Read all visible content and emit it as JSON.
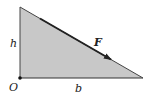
{
  "diagram": {
    "type": "right-triangle-force",
    "labels": {
      "height": "h",
      "base": "b",
      "origin": "O",
      "force": "F"
    },
    "colors": {
      "fill": "#c8c8c8",
      "edge": "#333333",
      "arrow": "#222222",
      "background": "#ffffff"
    },
    "vertices": {
      "top": [
        20,
        7
      ],
      "origin": [
        20,
        78
      ],
      "right": [
        143,
        78
      ]
    }
  }
}
